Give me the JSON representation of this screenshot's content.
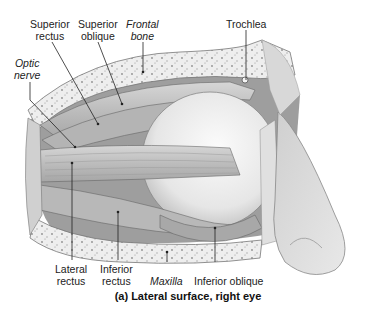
{
  "diagram": {
    "caption": "(a) Lateral surface, right eye",
    "labels": {
      "superior_rectus": {
        "line1": "Superior",
        "line2": "rectus"
      },
      "superior_oblique": {
        "line1": "Superior",
        "line2": "oblique"
      },
      "frontal_bone": {
        "line1": "Frontal",
        "line2": "bone"
      },
      "trochlea": {
        "line1": "Trochlea"
      },
      "optic_nerve": {
        "line1": "Optic",
        "line2": "nerve"
      },
      "lateral_rectus": {
        "line1": "Lateral",
        "line2": "rectus"
      },
      "inferior_rectus": {
        "line1": "Inferior",
        "line2": "rectus"
      },
      "maxilla": {
        "line1": "Maxilla"
      },
      "inferior_oblique": {
        "line1": "Inferior oblique"
      }
    },
    "colors": {
      "bone": "#e6e6e6",
      "bone_speckle": "#9a9a9a",
      "muscle": "#c8c8c8",
      "muscle_dark": "#8c8c8c",
      "eyeball": "#f2f2f2",
      "skin": "#d9d9d9",
      "leader": "#222222"
    }
  }
}
